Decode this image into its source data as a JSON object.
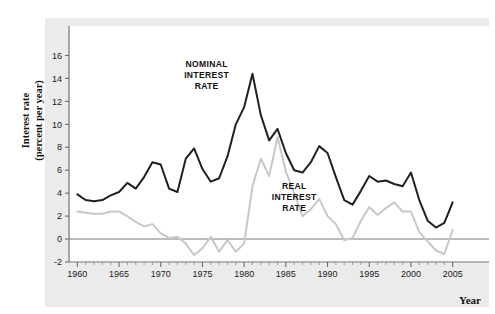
{
  "figure": {
    "background_color": "#ffffff",
    "panel_color": "#ebebeb",
    "plot_color": "#ffffff"
  },
  "axis_titles": {
    "y": "Interest rate\n(percent per year)",
    "x": "Year"
  },
  "chart_data": {
    "type": "line",
    "title": "",
    "subtitle": "",
    "xlabel": "Year",
    "ylabel": "Interest rate (percent per year)",
    "xlim": [
      1959,
      2006
    ],
    "ylim": [
      -2,
      17
    ],
    "xticks": [
      1960,
      1965,
      1970,
      1975,
      1980,
      1985,
      1990,
      1995,
      2000,
      2005
    ],
    "xtick_labels": [
      "1960",
      "1965",
      "1970",
      "1975",
      "1980",
      "1985",
      "1990",
      "1995",
      "2000",
      "2005"
    ],
    "x_minor_tick_step": 1,
    "yticks": [
      -2,
      0,
      2,
      4,
      6,
      8,
      10,
      12,
      14,
      16
    ],
    "ytick_labels": [
      "-2",
      "0",
      "2",
      "4",
      "6",
      "8",
      "10",
      "12",
      "14",
      "16"
    ],
    "grid": false,
    "zero_line": 0,
    "legend": "inline-annotations",
    "annotations": [
      {
        "text": "NOMINAL\nINTEREST\nRATE",
        "x": 1975.5,
        "y": 15.0
      },
      {
        "text": "REAL\nINTEREST\nRATE",
        "x": 1986.0,
        "y": 4.4
      }
    ],
    "x": [
      1960,
      1961,
      1962,
      1963,
      1964,
      1965,
      1966,
      1967,
      1968,
      1969,
      1970,
      1971,
      1972,
      1973,
      1974,
      1975,
      1976,
      1977,
      1978,
      1979,
      1980,
      1981,
      1982,
      1983,
      1984,
      1985,
      1986,
      1987,
      1988,
      1989,
      1990,
      1991,
      1992,
      1993,
      1994,
      1995,
      1996,
      1997,
      1998,
      1999,
      2000,
      2001,
      2002,
      2003,
      2004,
      2005
    ],
    "series": [
      {
        "name": "NOMINAL INTEREST RATE",
        "color": "#231f20",
        "width": 2.0,
        "values": [
          3.9,
          3.4,
          3.3,
          3.4,
          3.8,
          4.1,
          4.9,
          4.4,
          5.4,
          6.7,
          6.5,
          4.4,
          4.1,
          7.0,
          7.9,
          6.1,
          5.0,
          5.3,
          7.2,
          10.0,
          11.5,
          14.4,
          10.8,
          8.6,
          9.6,
          7.5,
          6.0,
          5.8,
          6.7,
          8.1,
          7.5,
          5.4,
          3.4,
          3.0,
          4.2,
          5.5,
          5.0,
          5.1,
          4.8,
          4.6,
          5.8,
          3.4,
          1.6,
          1.0,
          1.4,
          3.2
        ]
      },
      {
        "name": "REAL INTEREST RATE",
        "color": "#c8c8c8",
        "width": 2.0,
        "values": [
          2.4,
          2.3,
          2.2,
          2.2,
          2.4,
          2.4,
          2.0,
          1.5,
          1.1,
          1.3,
          0.5,
          0.1,
          0.2,
          -0.4,
          -1.4,
          -0.8,
          0.2,
          -1.1,
          -0.1,
          -1.1,
          -0.4,
          4.6,
          7.0,
          5.5,
          8.9,
          5.9,
          4.0,
          2.0,
          2.6,
          3.5,
          2.0,
          1.3,
          -0.1,
          0.1,
          1.6,
          2.8,
          2.1,
          2.7,
          3.2,
          2.4,
          2.4,
          0.6,
          -0.2,
          -1.0,
          -1.3,
          0.8
        ]
      }
    ]
  }
}
